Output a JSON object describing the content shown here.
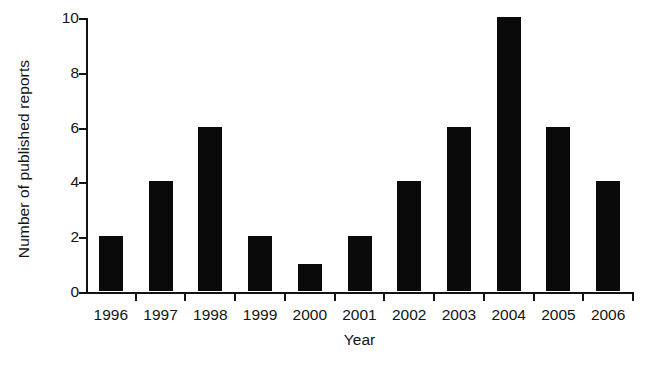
{
  "chart_data": {
    "type": "bar",
    "title": "",
    "subtitle": "",
    "xlabel": "Year",
    "ylabel": "Number of published reports",
    "categories": [
      "1996",
      "1997",
      "1998",
      "1999",
      "2000",
      "2001",
      "2002",
      "2003",
      "2004",
      "2005",
      "2006"
    ],
    "values": [
      2,
      4,
      6,
      2,
      1,
      2,
      4,
      6,
      10,
      6,
      4
    ],
    "series": [
      {
        "name": "Number of published reports",
        "values": [
          2,
          4,
          6,
          2,
          1,
          2,
          4,
          6,
          10,
          6,
          4
        ]
      }
    ],
    "ylim": [
      0,
      10
    ],
    "yticks": [
      0,
      2,
      4,
      6,
      8,
      10
    ],
    "ytick_labels": [
      "0",
      "2",
      "4",
      "6",
      "8",
      "10"
    ],
    "xtick_labels": [
      "1996",
      "1997",
      "1998",
      "1999",
      "2000",
      "2001",
      "2002",
      "2003",
      "2004",
      "2005",
      "2006"
    ],
    "grid": false,
    "legend": false,
    "legend_position": "none",
    "bar_color": "#0a0a0a",
    "axis_color": "#121212",
    "background_color": "#ffffff",
    "annotations": []
  },
  "axes": {
    "y_title": "Number of published reports",
    "x_title": "Year"
  }
}
